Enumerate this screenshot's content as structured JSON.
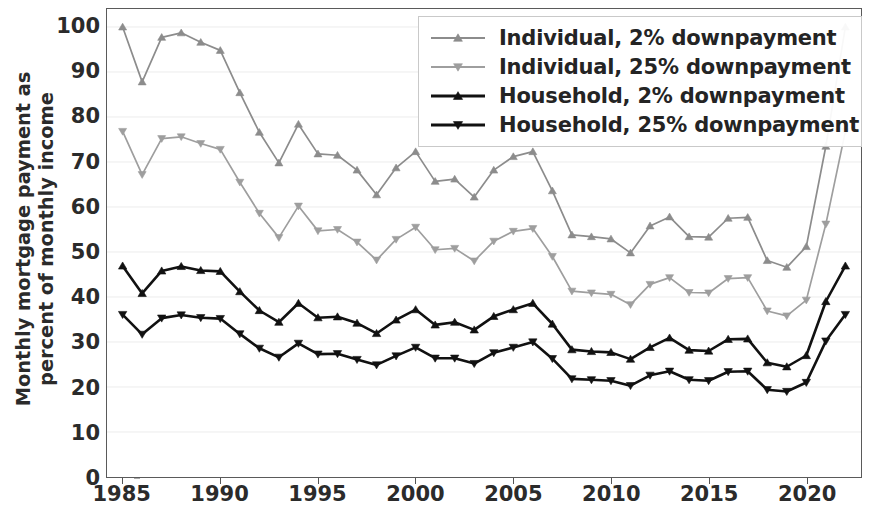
{
  "chart_data": {
    "type": "line",
    "title": "",
    "xlabel": "",
    "ylabel": "Monthly mortgage payment as percent of monthly income",
    "ylabel_line1": "Monthly mortgage payment as",
    "ylabel_line2": "percent of monthly income",
    "xlim": [
      1984.2,
      2022.8
    ],
    "ylim": [
      0,
      104
    ],
    "ytick_labels": [
      "0",
      "10",
      "20",
      "30",
      "40",
      "50",
      "60",
      "70",
      "80",
      "90",
      "100"
    ],
    "ytick_values": [
      0,
      10,
      20,
      30,
      40,
      50,
      60,
      70,
      80,
      90,
      100
    ],
    "xtick_labels": [
      "1985",
      "1990",
      "1995",
      "2000",
      "2005",
      "2010",
      "2015",
      "2020"
    ],
    "xtick_values": [
      1985,
      1990,
      1995,
      2000,
      2005,
      2010,
      2015,
      2020
    ],
    "grid": true,
    "grid_axis": "y",
    "legend_position": "top-right",
    "x": [
      1985,
      1986,
      1987,
      1988,
      1989,
      1990,
      1991,
      1992,
      1993,
      1994,
      1995,
      1996,
      1997,
      1998,
      1999,
      2000,
      2001,
      2002,
      2003,
      2004,
      2005,
      2006,
      2007,
      2008,
      2009,
      2010,
      2011,
      2012,
      2013,
      2014,
      2015,
      2016,
      2017,
      2018,
      2019,
      2020,
      2021,
      2022
    ],
    "series": [
      {
        "name": "Individual, 2% downpayment",
        "color": "#8c8c8c",
        "marker": "triangle-up",
        "values": [
          100.0,
          87.8,
          97.7,
          98.7,
          96.6,
          94.8,
          85.4,
          76.6,
          69.8,
          78.4,
          71.8,
          71.5,
          68.2,
          62.7,
          68.7,
          72.3,
          65.7,
          66.2,
          62.2,
          68.2,
          71.2,
          72.3,
          63.6,
          53.8,
          53.4,
          52.9,
          49.8,
          55.8,
          57.8,
          53.4,
          53.3,
          57.5,
          57.7,
          48.1,
          46.6,
          51.2,
          73.5,
          100.0
        ]
      },
      {
        "name": "Individual, 25% downpayment",
        "color": "#9e9e9e",
        "marker": "triangle-down",
        "values": [
          76.8,
          67.2,
          75.2,
          75.6,
          74.1,
          72.8,
          65.5,
          58.6,
          53.2,
          60.2,
          54.7,
          55.0,
          52.2,
          48.2,
          52.8,
          55.5,
          50.5,
          50.8,
          48.0,
          52.4,
          54.6,
          55.2,
          49.0,
          41.3,
          40.9,
          40.6,
          38.3,
          42.8,
          44.3,
          41.0,
          40.9,
          44.1,
          44.3,
          36.9,
          35.8,
          39.3,
          56.2,
          76.8
        ]
      },
      {
        "name": "Household, 2% downpayment",
        "color": "#111111",
        "marker": "triangle-up",
        "values": [
          46.9,
          40.8,
          45.8,
          46.8,
          45.9,
          45.7,
          41.2,
          37.0,
          34.4,
          38.6,
          35.4,
          35.6,
          34.2,
          31.9,
          34.9,
          37.2,
          33.8,
          34.4,
          32.7,
          35.7,
          37.2,
          38.6,
          34.0,
          28.3,
          27.9,
          27.7,
          26.2,
          28.8,
          30.9,
          28.2,
          28.0,
          30.6,
          30.7,
          25.4,
          24.5,
          27.0,
          39.0,
          46.9
        ]
      },
      {
        "name": "Household, 25% downpayment",
        "color": "#111111",
        "marker": "triangle-down",
        "values": [
          36.1,
          31.7,
          35.3,
          36.0,
          35.4,
          35.2,
          31.8,
          28.6,
          26.6,
          29.7,
          27.3,
          27.4,
          26.1,
          24.9,
          26.9,
          28.8,
          26.4,
          26.4,
          25.2,
          27.6,
          28.8,
          30.0,
          26.3,
          21.8,
          21.6,
          21.4,
          20.3,
          22.6,
          23.5,
          21.6,
          21.4,
          23.4,
          23.5,
          19.4,
          19.0,
          21.0,
          30.2,
          36.1
        ]
      }
    ]
  },
  "legend": {
    "items": [
      {
        "label": "Individual, 2% downpayment"
      },
      {
        "label": "Individual, 25% downpayment"
      },
      {
        "label": "Household, 2% downpayment"
      },
      {
        "label": "Household, 25% downpayment"
      }
    ]
  },
  "colors": {
    "gray_light": "#9e9e9e",
    "gray_mid": "#8c8c8c",
    "black": "#111111",
    "axis": "#5a5a5a",
    "grid": "#ececec",
    "text": "#2b2b2b"
  },
  "top_strip_text": ""
}
